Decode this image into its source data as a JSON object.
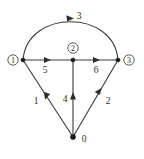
{
  "figure": {
    "kind": "directed-graph-diagram",
    "background_color": "#ffffff",
    "stroke_color": "#3a3a3a",
    "text_color": "#2b2b2b"
  },
  "nodes": [
    {
      "id": "n1",
      "label": "1",
      "display": "circled",
      "x": 23,
      "y": 60,
      "label_x": 13,
      "label_y": 60
    },
    {
      "id": "n2",
      "label": "2",
      "display": "circled",
      "x": 73,
      "y": 60,
      "label_x": 73,
      "label_y": 48
    },
    {
      "id": "n3",
      "label": "3",
      "display": "circled",
      "x": 118,
      "y": 60,
      "label_x": 129,
      "label_y": 60
    },
    {
      "id": "n0",
      "label": "0",
      "display": "plain",
      "x": 73,
      "y": 137,
      "label_x": 84,
      "label_y": 139
    }
  ],
  "edges": [
    {
      "id": "e3",
      "label": "3",
      "from": "n1",
      "to": "n3",
      "shape": "arc",
      "label_x": 79,
      "label_y": 16
    },
    {
      "id": "e5",
      "label": "5",
      "from": "n1",
      "to": "n2",
      "shape": "line",
      "label_x": 45,
      "label_y": 70
    },
    {
      "id": "e6",
      "label": "6",
      "from": "n2",
      "to": "n3",
      "shape": "line",
      "label_x": 96,
      "label_y": 70
    },
    {
      "id": "e1",
      "label": "1",
      "from": "n0",
      "to": "n1",
      "shape": "line",
      "label_x": 36,
      "label_y": 101
    },
    {
      "id": "e2",
      "label": "2",
      "from": "n0",
      "to": "n3",
      "shape": "line",
      "label_x": 108,
      "label_y": 101
    },
    {
      "id": "e4",
      "label": "4",
      "from": "n0",
      "to": "n2",
      "shape": "line",
      "label_x": 65,
      "label_y": 99
    }
  ]
}
